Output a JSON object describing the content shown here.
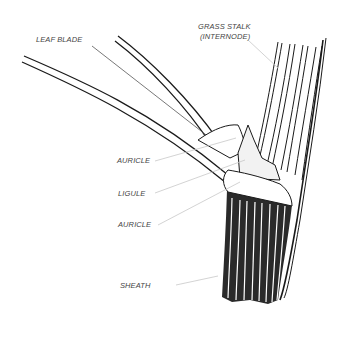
{
  "diagram": {
    "labels": {
      "leaf_blade": "LEAF BLADE",
      "grass_stalk_line1": "GRASS STALK",
      "grass_stalk_line2": "(INTERNODE)",
      "auricle_top": "AURICLE",
      "ligule": "LIGULE",
      "auricle_bottom": "AURICLE",
      "sheath": "SHEATH"
    },
    "colors": {
      "ink": "#1a1a1a",
      "leader_line": "#c8c8c8",
      "label_text": "#444444",
      "background": "#ffffff"
    }
  }
}
